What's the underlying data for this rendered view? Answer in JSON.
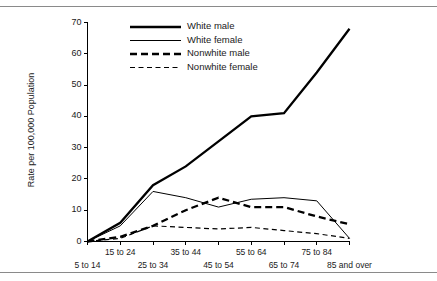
{
  "chart_data": {
    "type": "line",
    "title": "",
    "xlabel": "",
    "ylabel": "Rate per 100,000 Population",
    "categories": [
      "5 to 14",
      "15 to 24",
      "25 to 34",
      "35 to 44",
      "45 to 54",
      "55 to 64",
      "65 to 74",
      "75 to 84",
      "85 and over"
    ],
    "ylim": [
      0,
      70
    ],
    "yticks": [
      0,
      10,
      20,
      30,
      40,
      50,
      60,
      70
    ],
    "ytick_labels": [
      "0",
      "10",
      "20",
      "30",
      "40",
      "50",
      "60",
      "70"
    ],
    "grid": false,
    "legend_position": "upper-left-inside",
    "series": [
      {
        "name": "White male",
        "style": "solid",
        "width": "thick",
        "color": "#000000",
        "values": [
          0,
          6,
          18,
          24,
          32,
          40,
          41,
          54,
          68
        ]
      },
      {
        "name": "White female",
        "style": "solid",
        "width": "thin",
        "color": "#000000",
        "values": [
          0,
          5,
          16,
          14,
          11,
          13.5,
          14,
          13,
          1
        ]
      },
      {
        "name": "Nonwhite male",
        "style": "dashed",
        "width": "thick",
        "color": "#000000",
        "values": [
          0,
          1.5,
          5,
          10,
          14,
          11,
          11,
          8,
          5.5
        ]
      },
      {
        "name": "Nonwhite female",
        "style": "dashed",
        "width": "thin",
        "color": "#000000",
        "values": [
          0,
          1,
          5,
          4.5,
          4,
          4.5,
          3.5,
          2.5,
          1
        ]
      }
    ]
  },
  "axis": {
    "y_title": "Rate per 100,000 Population",
    "y_ticks": [
      "70",
      "60",
      "50",
      "40",
      "30",
      "20",
      "10",
      "0"
    ],
    "x_labels_upper": [
      "15 to 24",
      "35 to 44",
      "55 to 64",
      "75 to 84"
    ],
    "x_labels_lower": [
      "5 to 14",
      "25 to 34",
      "45 to 54",
      "65 to 74",
      "85 and over"
    ]
  },
  "legend": {
    "items": [
      {
        "label": "White male"
      },
      {
        "label": "White female"
      },
      {
        "label": "Nonwhite male"
      },
      {
        "label": "Nonwhite female"
      }
    ]
  }
}
